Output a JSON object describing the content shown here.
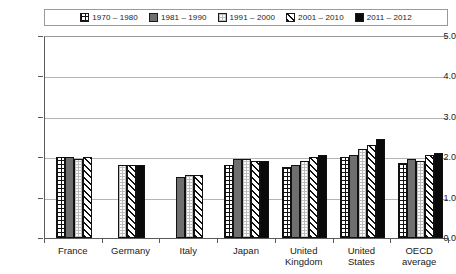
{
  "chart_data": {
    "type": "bar",
    "title": "",
    "subtitle": "",
    "xlabel": "",
    "ylabel": "",
    "ylim": [
      0.0,
      5.0
    ],
    "ytick_labels": [
      "5.0",
      "4.0",
      "3.0",
      "2.0",
      "1.0",
      "0.0"
    ],
    "ytick_values": [
      5.0,
      4.0,
      3.0,
      2.0,
      1.0,
      0.0
    ],
    "grid": true,
    "legend_position": "top",
    "categories": [
      "France",
      "Germany",
      "Italy",
      "Japan",
      "United Kingdom",
      "United States",
      "OECD average"
    ],
    "category_lines": [
      [
        "France"
      ],
      [
        "Germany"
      ],
      [
        "Italy"
      ],
      [
        "Japan"
      ],
      [
        "United",
        "Kingdom"
      ],
      [
        "United",
        "States"
      ],
      [
        "OECD",
        "average"
      ]
    ],
    "series": [
      {
        "name": "1970 – 1980",
        "pattern": "grid",
        "values": [
          2.0,
          null,
          null,
          1.8,
          1.75,
          2.0,
          1.85
        ]
      },
      {
        "name": "1981 – 1990",
        "pattern": "gray",
        "values": [
          2.0,
          null,
          1.5,
          1.95,
          1.8,
          2.05,
          1.95
        ]
      },
      {
        "name": "1991 – 2000",
        "pattern": "dot",
        "values": [
          1.95,
          1.8,
          1.55,
          1.95,
          1.9,
          2.2,
          1.9
        ]
      },
      {
        "name": "2001 – 2010",
        "pattern": "diag",
        "values": [
          2.0,
          1.8,
          1.55,
          1.9,
          2.0,
          2.3,
          2.05
        ]
      },
      {
        "name": "2011 – 2012",
        "pattern": "black",
        "values": [
          null,
          1.8,
          null,
          1.9,
          2.05,
          2.45,
          2.1
        ]
      }
    ]
  },
  "legend": {
    "items": [
      {
        "label": "1970 – 1980",
        "pattern": "grid"
      },
      {
        "label": "1981 – 1990",
        "pattern": "gray"
      },
      {
        "label": "1991 – 2000",
        "pattern": "dot"
      },
      {
        "label": "2001 – 2010",
        "pattern": "diag"
      },
      {
        "label": "2011 – 2012",
        "pattern": "black"
      }
    ]
  },
  "colors": {
    "axis": "#5a5a5a",
    "gridline": "#b4b4b4",
    "bar_outline": "#111111",
    "gray_fill": "#6f6f6f",
    "black_fill": "#0a0a0a",
    "background": "#ffffff"
  }
}
